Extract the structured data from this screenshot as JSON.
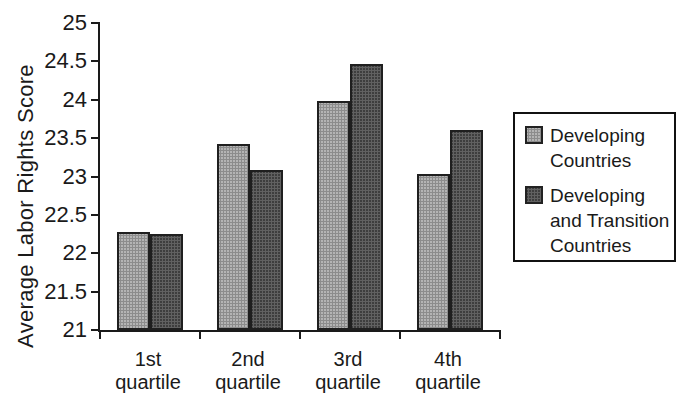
{
  "figure": {
    "background_color": "#ffffff",
    "axis_color": "#1a1a1a",
    "text_color": "#1a1a1a",
    "bar_border_color": "#1f1f1f"
  },
  "chart_data": {
    "type": "bar",
    "title": "",
    "xlabel": "",
    "ylabel": "Average Labor Rights Score",
    "categories": [
      "1st quartile",
      "2nd quartile",
      "3rd quartile",
      "4th quartile"
    ],
    "series": [
      {
        "name": "Developing Countries",
        "color": "#b4b4b4",
        "values": [
          22.28,
          23.43,
          23.98,
          23.03
        ]
      },
      {
        "name": "Developing and Transition Countries",
        "color": "#3e3e3e",
        "values": [
          22.25,
          23.09,
          24.47,
          23.6
        ]
      }
    ],
    "ylim": [
      21,
      25
    ],
    "ytick_step": 0.5,
    "yticks": [
      21,
      21.5,
      22,
      22.5,
      23,
      23.5,
      24,
      24.5,
      25
    ],
    "grid": false,
    "legend_position": "right"
  }
}
